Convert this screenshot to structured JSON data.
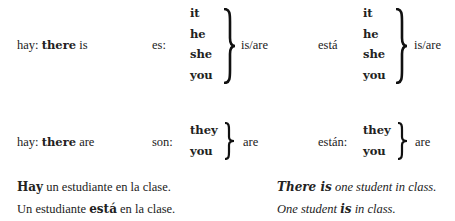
{
  "row_singular": {
    "hay": {
      "prefix": "hay:",
      "bold": "there",
      "suffix": "is"
    },
    "es": {
      "label": "es:",
      "pronouns": [
        "it",
        "he",
        "she",
        "you"
      ],
      "meaning": "is/are"
    },
    "esta": {
      "label": "está",
      "pronouns": [
        "it",
        "he",
        "she",
        "you"
      ],
      "meaning": "is/are"
    }
  },
  "row_plural": {
    "hay": {
      "prefix": "hay:",
      "bold": "there",
      "suffix": "are"
    },
    "son": {
      "label": "son:",
      "pronouns": [
        "they",
        "you"
      ],
      "meaning": "are"
    },
    "estan": {
      "label": "están:",
      "pronouns": [
        "they",
        "you"
      ],
      "meaning": "are"
    }
  },
  "examples": {
    "spanish": [
      {
        "bold": "Hay",
        "rest": " un estudiante en la clase."
      },
      {
        "pre": "Un estudiante ",
        "bold": "está",
        "rest": " en la clase."
      }
    ],
    "english": [
      {
        "bold": "There is",
        "rest": " one student in class."
      },
      {
        "pre": "One student ",
        "bold": "is",
        "rest": " in class."
      }
    ]
  }
}
